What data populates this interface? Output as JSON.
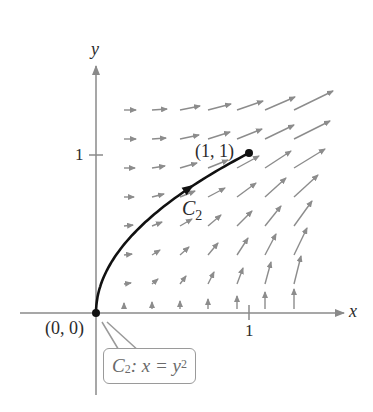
{
  "chart_data": {
    "type": "vector-field",
    "title": "",
    "xlabel": "x",
    "ylabel": "y",
    "x_ticks": [
      {
        "value": 1,
        "label": "1"
      }
    ],
    "y_ticks": [
      {
        "value": 1,
        "label": "1"
      }
    ],
    "xlim": [
      -0.5,
      1.6
    ],
    "ylim": [
      -0.45,
      1.65
    ],
    "grid": false,
    "legend": null,
    "curve": {
      "name": "C2",
      "equation": "x = y^2",
      "from": [
        0,
        0
      ],
      "to": [
        1,
        1
      ],
      "direction": "from (0, 0) to (1, 1)"
    },
    "points": [
      {
        "label": "(0, 0)",
        "x": 0,
        "y": 0
      },
      {
        "label": "(1, 1)",
        "x": 1,
        "y": 1
      }
    ],
    "annotations": [
      "C2",
      "C2: x = y^2"
    ],
    "vector_grid": {
      "columns_x_px": [
        124,
        152,
        180,
        208,
        237,
        265,
        294
      ],
      "rows_y_px": [
        110,
        139,
        168,
        197,
        226,
        255,
        284,
        309
      ]
    },
    "arrows_px": [
      [
        124,
        110,
        136,
        110
      ],
      [
        152,
        110,
        167,
        109
      ],
      [
        180,
        110,
        200,
        106
      ],
      [
        208,
        110,
        231,
        104
      ],
      [
        237,
        110,
        263,
        101
      ],
      [
        265,
        110,
        295,
        97
      ],
      [
        294,
        110,
        333,
        91
      ],
      [
        124,
        139,
        136,
        139
      ],
      [
        152,
        139,
        166,
        138
      ],
      [
        180,
        139,
        199,
        135
      ],
      [
        208,
        139,
        230,
        132
      ],
      [
        237,
        139,
        262,
        129
      ],
      [
        265,
        139,
        294,
        125
      ],
      [
        294,
        139,
        330,
        121
      ],
      [
        124,
        168,
        135,
        168
      ],
      [
        152,
        168,
        165,
        166
      ],
      [
        180,
        168,
        197,
        163
      ],
      [
        208,
        168,
        228,
        160
      ],
      [
        237,
        168,
        259,
        156
      ],
      [
        265,
        168,
        291,
        151
      ],
      [
        294,
        168,
        325,
        149
      ],
      [
        124,
        197,
        134,
        197
      ],
      [
        152,
        197,
        164,
        194
      ],
      [
        180,
        197,
        195,
        191
      ],
      [
        208,
        197,
        225,
        188
      ],
      [
        237,
        197,
        256,
        183
      ],
      [
        265,
        197,
        286,
        178
      ],
      [
        294,
        197,
        318,
        175
      ],
      [
        124,
        226,
        133,
        225
      ],
      [
        152,
        226,
        162,
        222
      ],
      [
        180,
        226,
        192,
        219
      ],
      [
        208,
        226,
        221,
        215
      ],
      [
        237,
        226,
        252,
        211
      ],
      [
        265,
        226,
        281,
        206
      ],
      [
        294,
        226,
        312,
        201
      ],
      [
        124,
        255,
        132,
        254
      ],
      [
        152,
        255,
        160,
        250
      ],
      [
        180,
        255,
        189,
        247
      ],
      [
        208,
        255,
        218,
        243
      ],
      [
        237,
        255,
        248,
        238
      ],
      [
        265,
        255,
        276,
        234
      ],
      [
        294,
        255,
        307,
        228
      ],
      [
        124,
        284,
        131,
        283
      ],
      [
        152,
        284,
        158,
        279
      ],
      [
        180,
        284,
        186,
        276
      ],
      [
        208,
        284,
        214,
        272
      ],
      [
        237,
        284,
        243,
        268
      ],
      [
        265,
        284,
        271,
        262
      ],
      [
        294,
        284,
        301,
        256
      ],
      [
        124,
        309,
        124,
        303
      ],
      [
        152,
        309,
        152,
        302
      ],
      [
        180,
        309,
        180,
        301
      ],
      [
        208,
        309,
        208,
        299
      ],
      [
        237,
        309,
        237,
        296
      ],
      [
        265,
        309,
        265,
        292
      ],
      [
        294,
        309,
        294,
        289
      ]
    ]
  },
  "labels": {
    "y_axis": "y",
    "x_axis": "x",
    "y_tick_1": "1",
    "x_tick_1": "1",
    "origin_point": "(0, 0)",
    "end_point": "(1, 1)",
    "curve_name_main": "C",
    "curve_name_sub": "2",
    "callout_c": "C",
    "callout_sub": "2",
    "callout_rest": ": x = y",
    "callout_sup": "2"
  },
  "colors": {
    "axis": "#8a8a8a",
    "field_arrows": "#8c8c8c",
    "curve": "#111111",
    "callout_border": "#9a9a9a",
    "callout_text": "#6a6a6a"
  }
}
